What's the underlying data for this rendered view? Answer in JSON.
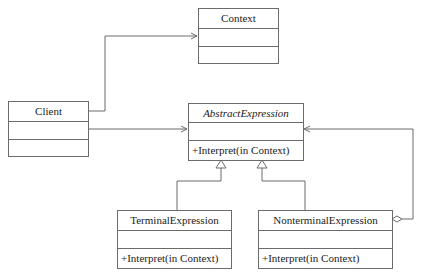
{
  "diagram": {
    "type": "UML class diagram",
    "pattern": "Interpreter",
    "classes": {
      "context": {
        "name": "Context",
        "abstract": false,
        "attributes": "",
        "operations": ""
      },
      "client": {
        "name": "Client",
        "abstract": false,
        "attributes": "",
        "operations": ""
      },
      "abstract_expression": {
        "name": "AbstractExpression",
        "abstract": true,
        "attributes": "",
        "operations": "+Interpret(in Context)"
      },
      "terminal_expression": {
        "name": "TerminalExpression",
        "abstract": false,
        "attributes": "",
        "operations": "+Interpret(in Context)"
      },
      "nonterminal_expression": {
        "name": "NonterminalExpression",
        "abstract": false,
        "attributes": "",
        "operations": "+Interpret(in Context)"
      }
    },
    "relationships": [
      {
        "from": "Client",
        "to": "Context",
        "kind": "association"
      },
      {
        "from": "Client",
        "to": "AbstractExpression",
        "kind": "association"
      },
      {
        "from": "TerminalExpression",
        "to": "AbstractExpression",
        "kind": "generalization"
      },
      {
        "from": "NonterminalExpression",
        "to": "AbstractExpression",
        "kind": "generalization"
      },
      {
        "from": "NonterminalExpression",
        "to": "AbstractExpression",
        "kind": "aggregation"
      }
    ],
    "colors": {
      "line": "#6b6b6b",
      "background": "#ffffff",
      "text": "#222222"
    }
  }
}
